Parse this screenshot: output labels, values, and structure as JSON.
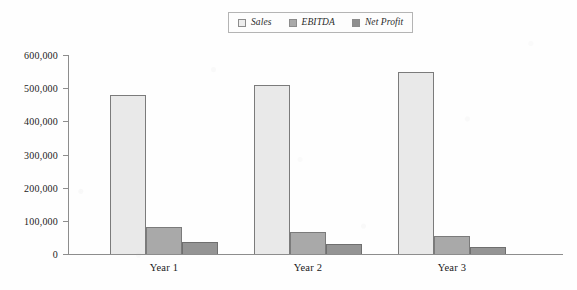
{
  "chart_data": {
    "type": "bar",
    "title": "",
    "subtitle": "",
    "xlabel": "",
    "ylabel": "",
    "categories": [
      "Year 1",
      "Year 2",
      "Year 3"
    ],
    "series": [
      {
        "name": "Sales",
        "values": [
          480000,
          510000,
          550000
        ],
        "color": "#e9e9e9",
        "border": "#7b7b7b"
      },
      {
        "name": "EBITDA",
        "values": [
          80000,
          67000,
          55000
        ],
        "color": "#a9a9a9",
        "border": "#7b7b7b"
      },
      {
        "name": "Net Profit",
        "values": [
          37000,
          31000,
          21000
        ],
        "color": "#949494",
        "border": "#6f6f6f"
      }
    ],
    "ylim": [
      0,
      600000
    ],
    "ytick_values": [
      0,
      100000,
      200000,
      300000,
      400000,
      500000,
      600000
    ],
    "ytick_labels": [
      "0",
      "100,000",
      "200,000",
      "300,000",
      "400,000",
      "500,000",
      "600,000"
    ],
    "grid": false,
    "legend_position": "top-center",
    "legend_entries": [
      {
        "label": "Sales",
        "swatch_color": "#ededed"
      },
      {
        "label": "EBITDA",
        "swatch_color": "#a9a9a9"
      },
      {
        "label": "Net Profit",
        "swatch_color": "#8f8f8f"
      }
    ]
  }
}
